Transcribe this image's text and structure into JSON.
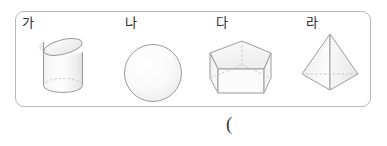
{
  "figure": {
    "box": {
      "border_color": "#b9b9b9",
      "background": "#ffffff"
    },
    "solids": [
      {
        "label": "가",
        "shape": "oblique-cylinder",
        "description": "slanted circular cylinder"
      },
      {
        "label": "나",
        "shape": "sphere",
        "description": "sphere"
      },
      {
        "label": "다",
        "shape": "pentagonal-prism",
        "description": "pentagonal prism"
      },
      {
        "label": "라",
        "shape": "pyramid",
        "description": "square pyramid"
      }
    ],
    "answer_paren": "("
  },
  "style": {
    "outline_color": "#9a9a9a",
    "hidden_edge_color": "#c0c0c0",
    "fill_light": "#fbfbfb",
    "fill_mid": "#f2f2f2",
    "fill_shade": "#e8e8e8",
    "label_color": "#2b2b2b"
  }
}
